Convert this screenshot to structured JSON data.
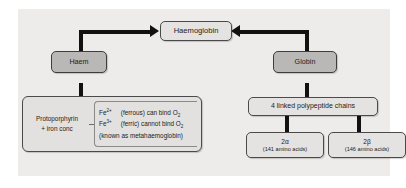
{
  "diagram": {
    "title_box": {
      "label": "Haemoglobin"
    },
    "left_branch": {
      "node": {
        "label": "Haem"
      },
      "detail": {
        "left_label_line1": "Protoporphyrin",
        "left_label_line2": "+ iron conc",
        "rows": [
          {
            "ion": "Fe",
            "charge": "2+",
            "text": "(ferrous) can bind O",
            "sub": "2"
          },
          {
            "ion": "Fe",
            "charge": "3+",
            "text": "(ferric) cannot bind O",
            "sub": "2"
          }
        ],
        "note": "(known as metahaemoglobin)"
      }
    },
    "right_branch": {
      "node": {
        "label": "Globin"
      },
      "detail": {
        "label": "4 linked polypeptide chains"
      },
      "chains": [
        {
          "label": "2α",
          "sublabel": "(141 amino acids)"
        },
        {
          "label": "2β",
          "sublabel": "(146 amino acids)"
        }
      ]
    },
    "colors": {
      "canvas": "#edecea",
      "box_fill": "#e2e1df",
      "shaded_fill": "#b9b8b6",
      "border": "#4a4a4a",
      "connector": "#111111",
      "text": "#1c1c1c"
    }
  }
}
